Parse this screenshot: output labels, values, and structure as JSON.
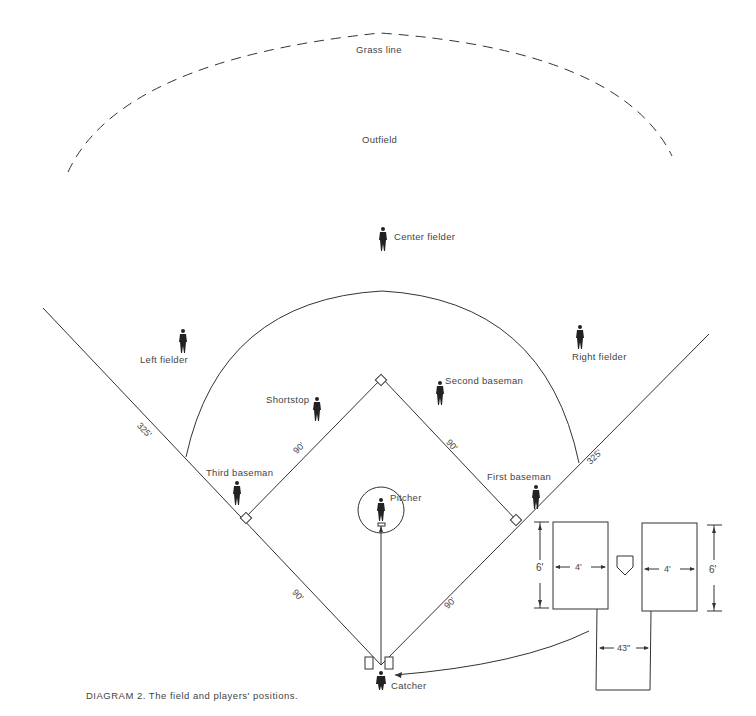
{
  "title": "DIAGRAM 2. The field and players' positions.",
  "field_labels": {
    "grass_line": "Grass line",
    "outfield": "Outfield"
  },
  "players": {
    "center_fielder": "Center fielder",
    "left_fielder": "Left fielder",
    "right_fielder": "Right fielder",
    "shortstop": "Shortstop",
    "second_baseman": "Second baseman",
    "third_baseman": "Third baseman",
    "first_baseman": "First baseman",
    "pitcher": "Pitcher",
    "catcher": "Catcher"
  },
  "dimensions": {
    "left_foul_line": "325'",
    "right_foul_line": "325'",
    "third_to_second": "90'",
    "second_to_first": "90'",
    "home_to_third": "90'",
    "home_to_first": "90'",
    "batters_box_width_left": "4'",
    "batters_box_width_right": "4'",
    "batters_box_length_left": "6'",
    "batters_box_length_right": "6'",
    "catchers_box_width": "43\""
  }
}
